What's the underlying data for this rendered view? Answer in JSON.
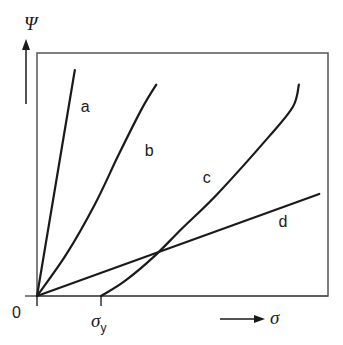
{
  "chart_data": {
    "type": "line",
    "title": "",
    "xlabel": "σ",
    "ylabel": "Ψ",
    "origin_label": "0",
    "x_tick_labels": [
      {
        "main": "σ",
        "sub": "y",
        "x": 0.22
      }
    ],
    "xlim": [
      0,
      1
    ],
    "ylim": [
      0,
      1
    ],
    "grid": false,
    "legend": "none (inline curve labels)",
    "series": [
      {
        "name": "a",
        "label_at": [
          0.15,
          0.78
        ],
        "points": [
          [
            0,
            0
          ],
          [
            0.13,
            0.93
          ]
        ]
      },
      {
        "name": "b",
        "label_at": [
          0.37,
          0.6
        ],
        "points": [
          [
            0,
            0
          ],
          [
            0.1,
            0.17
          ],
          [
            0.2,
            0.38
          ],
          [
            0.28,
            0.58
          ],
          [
            0.36,
            0.77
          ],
          [
            0.41,
            0.87
          ]
        ]
      },
      {
        "name": "c",
        "label_at": [
          0.57,
          0.49
        ],
        "points": [
          [
            0.22,
            0
          ],
          [
            0.3,
            0.06
          ],
          [
            0.4,
            0.16
          ],
          [
            0.5,
            0.28
          ],
          [
            0.62,
            0.42
          ],
          [
            0.8,
            0.66
          ],
          [
            0.88,
            0.78
          ],
          [
            0.9,
            0.87
          ]
        ]
      },
      {
        "name": "d",
        "label_at": [
          0.83,
          0.31
        ],
        "points": [
          [
            0,
            0
          ],
          [
            0.97,
            0.42
          ]
        ]
      }
    ],
    "line_color": "#1a1a1a",
    "frame_color": "#555555"
  }
}
